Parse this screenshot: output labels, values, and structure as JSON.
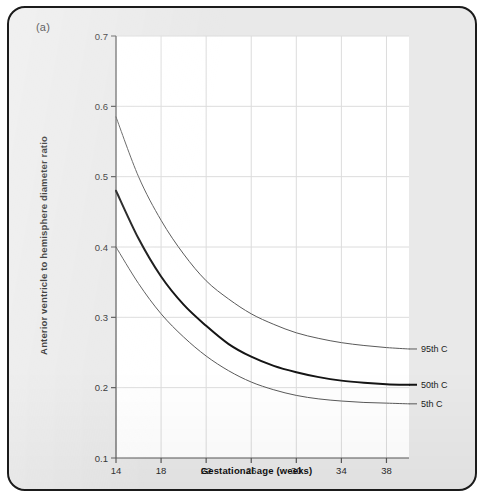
{
  "figure": {
    "panel_label": "(a)",
    "background_color": "#e9e9e9",
    "border_color": "#1b1b1b",
    "plot_background_color": "#ffffff"
  },
  "chart_data": {
    "type": "line",
    "title": "",
    "xlabel": "Gestational age (weeks)",
    "ylabel": "Anterior ventricle to hemisphere diameter ratio",
    "xlim": [
      14,
      40
    ],
    "ylim": [
      0.1,
      0.7
    ],
    "xticks": [
      14,
      18,
      22,
      26,
      30,
      34,
      38
    ],
    "xticklabels": [
      "14",
      "18",
      "22",
      "26",
      "30",
      "34",
      "38"
    ],
    "yticks": [
      0.1,
      0.2,
      0.3,
      0.4,
      0.5,
      0.6,
      0.7
    ],
    "yticklabels": [
      "0.1",
      "0.2",
      "0.3",
      "0.4",
      "0.5",
      "0.6",
      "0.7"
    ],
    "grid": true,
    "grid_color": "#dcdcdc",
    "legend_position": "right-inline-labels",
    "x": [
      14,
      16,
      18,
      20,
      22,
      24,
      26,
      28,
      30,
      32,
      34,
      36,
      38,
      40
    ],
    "series": [
      {
        "name": "95th C",
        "label": "95th C",
        "color": "#5a5a5a",
        "width": 1.0,
        "values": [
          0.585,
          0.5,
          0.438,
          0.39,
          0.352,
          0.326,
          0.305,
          0.29,
          0.278,
          0.27,
          0.264,
          0.26,
          0.257,
          0.255
        ]
      },
      {
        "name": "50th C",
        "label": "50th C",
        "color": "#151515",
        "width": 2.0,
        "values": [
          0.48,
          0.412,
          0.358,
          0.318,
          0.288,
          0.262,
          0.244,
          0.231,
          0.222,
          0.215,
          0.21,
          0.207,
          0.205,
          0.204
        ]
      },
      {
        "name": "5th C",
        "label": "5th C",
        "color": "#5a5a5a",
        "width": 1.0,
        "values": [
          0.4,
          0.348,
          0.305,
          0.272,
          0.245,
          0.224,
          0.208,
          0.197,
          0.189,
          0.184,
          0.181,
          0.179,
          0.178,
          0.177
        ]
      }
    ],
    "curve_labels": [
      {
        "text": "95th C",
        "series": "95th C"
      },
      {
        "text": "50th C",
        "series": "50th C"
      },
      {
        "text": "5th C",
        "series": "5th C"
      }
    ]
  }
}
